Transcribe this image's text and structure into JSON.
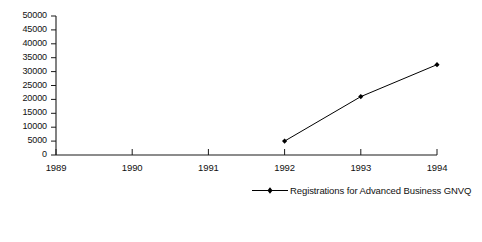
{
  "chart_data": {
    "type": "line",
    "title": "",
    "subtitle": "",
    "xlabel": "",
    "ylabel": "",
    "grid": false,
    "legend_position": "bottom-right",
    "x": [
      1989,
      1990,
      1991,
      1992,
      1993,
      1994
    ],
    "xtick_labels": [
      "1989",
      "1990",
      "1991",
      "1992",
      "1993",
      "1994"
    ],
    "xlim": [
      1989,
      1994
    ],
    "ylim": [
      0,
      50000
    ],
    "ytick_labels": [
      "0",
      "5000",
      "10000",
      "15000",
      "20000",
      "25000",
      "30000",
      "35000",
      "40000",
      "45000",
      "50000"
    ],
    "ytick_values": [
      0,
      5000,
      10000,
      15000,
      20000,
      25000,
      30000,
      35000,
      40000,
      45000,
      50000
    ],
    "series": [
      {
        "name": "Registrations for Advanced Business GNVQ",
        "marker": "diamond",
        "color": "#000000",
        "points": [
          {
            "x": 1992,
            "y": 5000
          },
          {
            "x": 1993,
            "y": 21000
          },
          {
            "x": 1994,
            "y": 32500
          }
        ]
      }
    ],
    "legend": [
      {
        "label": "Registrations for Advanced Business GNVQ",
        "color": "#000000",
        "marker": "diamond"
      }
    ]
  },
  "colors": {
    "axis": "#1a1a1a",
    "series": "#000000",
    "text": "#111111",
    "background": "#ffffff"
  }
}
